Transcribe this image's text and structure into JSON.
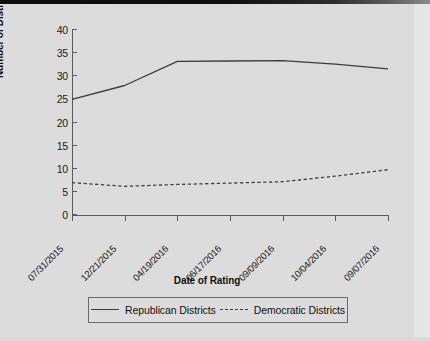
{
  "chart_data": {
    "type": "line",
    "title": "",
    "xlabel": "Date of Rating",
    "ylabel": "Number of Districts",
    "categories": [
      "07/31/2015",
      "12/21/2015",
      "04/19/2016",
      "06/17/2016",
      "09/09/2016",
      "10/04/2016",
      "09/07/2016"
    ],
    "x": [
      0,
      1,
      2,
      3,
      4,
      5,
      6
    ],
    "ylim": [
      0,
      40
    ],
    "yticks": [
      0,
      5,
      10,
      15,
      20,
      25,
      30,
      35,
      40
    ],
    "grid": false,
    "legend_position": "bottom",
    "series": [
      {
        "name": "Republican Districts",
        "style": "solid",
        "color": "#3c3c3c",
        "values": [
          25.0,
          28.0,
          33.2,
          33.3,
          33.4,
          32.6,
          31.6
        ]
      },
      {
        "name": "Democratic Districts",
        "style": "dashed",
        "color": "#3c3c3c",
        "values": [
          7.0,
          6.2,
          6.6,
          6.9,
          7.2,
          8.4,
          9.8
        ]
      }
    ]
  },
  "axes": {
    "y_title": "Number of Districts",
    "x_title": "Date of Rating",
    "y_tick_labels": [
      "40",
      "35",
      "30",
      "25",
      "20",
      "15",
      "10",
      "5",
      "0"
    ],
    "x_tick_labels": [
      "07/31/2015",
      "12/21/2015",
      "04/19/2016",
      "06/17/2016",
      "09/09/2016",
      "10/04/2016",
      "09/07/2016"
    ]
  },
  "legend": {
    "entries": [
      {
        "label": "Republican Districts",
        "style": "solid"
      },
      {
        "label": "Democratic Districts",
        "style": "dashed"
      }
    ]
  },
  "colors": {
    "page_background": "#dcdcdc",
    "line": "#3c3c3c",
    "axis": "#5b5b5b",
    "text": "#111111"
  }
}
